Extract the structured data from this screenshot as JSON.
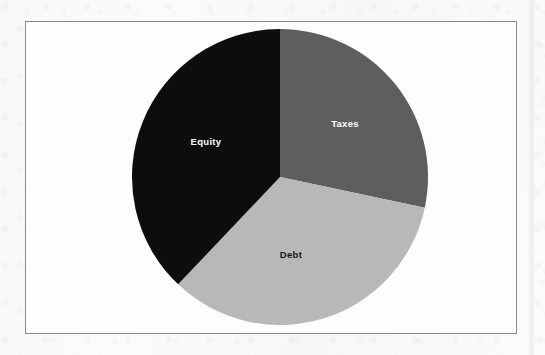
{
  "figure": {
    "frame_border_color": "#8a8a8a",
    "background_color": "#fbfbfb",
    "plot_background_color": "#fdfdfd"
  },
  "chart_data": {
    "type": "pie",
    "title": "",
    "subtitle": "",
    "xlabel": "",
    "ylabel": "",
    "grid": false,
    "legend_position": "none",
    "labels_inside_slices": true,
    "start_angle_deg": 0,
    "direction": "clockwise",
    "categories": [
      "Taxes",
      "Debt",
      "Equity"
    ],
    "values": [
      28.3,
      33.8,
      37.9
    ],
    "slices": [
      {
        "label": "Taxes",
        "value": 28.3,
        "color": "#5e5e5e",
        "label_color": "#ffffff",
        "start_angle_deg": 0,
        "end_angle_deg": 102,
        "label_x": 345,
        "label_y": 127
      },
      {
        "label": "Debt",
        "value": 33.8,
        "color": "#b8b8b8",
        "label_color": "#16181a",
        "start_angle_deg": 102,
        "end_angle_deg": 223.5,
        "label_x": 291,
        "label_y": 258
      },
      {
        "label": "Equity",
        "value": 37.9,
        "color": "#0d0d0d",
        "label_color": "#ffffff",
        "start_angle_deg": 223.5,
        "end_angle_deg": 360,
        "label_x": 206,
        "label_y": 145
      }
    ],
    "geometry": {
      "center_x": 280,
      "center_y": 177,
      "radius": 148
    }
  }
}
